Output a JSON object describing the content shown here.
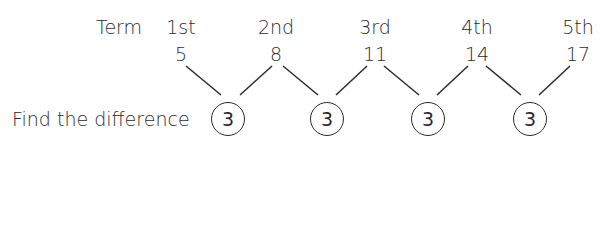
{
  "labels": {
    "term": "Term",
    "find_difference": "Find the difference"
  },
  "terms": [
    "1st",
    "2nd",
    "3rd",
    "4th",
    "5th"
  ],
  "values": [
    "5",
    "8",
    "11",
    "14",
    "17"
  ],
  "differences": [
    "3",
    "3",
    "3",
    "3"
  ],
  "colors": {
    "ink": "#2b2b2b",
    "background": "#ffffff"
  }
}
